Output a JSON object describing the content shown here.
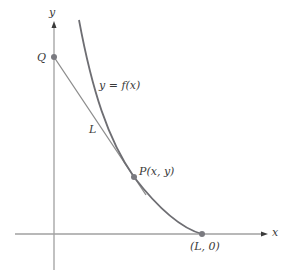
{
  "diagram": {
    "axes": {
      "x_label": "x",
      "y_label": "y"
    },
    "curve": {
      "label": "y = f(x)",
      "color": "#6e6e73"
    },
    "tangent_line": {
      "label": "L",
      "color": "#8a8a8a"
    },
    "points": {
      "Q": {
        "label": "Q"
      },
      "P": {
        "label": "P(x, y)"
      },
      "L0": {
        "label": "(L, 0)"
      }
    },
    "colors": {
      "axis": "#9a9a9a",
      "point": "#7a7a80",
      "text": "#3a3a3a"
    }
  }
}
